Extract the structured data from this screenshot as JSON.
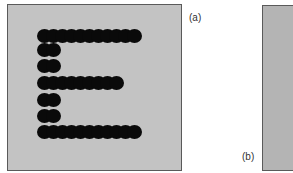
{
  "figure": {
    "panels": [
      {
        "id": "a",
        "label": "(a)",
        "content": "Letter E formed by black dots on gray background"
      },
      {
        "id": "b",
        "label": "(b)",
        "content": "Uniform gray panel (partially visible)"
      }
    ],
    "letter": "E",
    "colors": {
      "panel_a_background": "#c3c3c3",
      "panel_b_background": "#b4b4b4",
      "dot": "#0a0a0a",
      "border": "#5a5a5a"
    },
    "dot_rows": [
      {
        "y": 31,
        "x_start": 36,
        "x_end": 126,
        "count": 11
      },
      {
        "y": 45,
        "x_start": 36,
        "x_end": 45,
        "count": 2
      },
      {
        "y": 61,
        "x_start": 36,
        "x_end": 45,
        "count": 2
      },
      {
        "y": 78,
        "x_start": 36,
        "x_end": 108,
        "count": 9
      },
      {
        "y": 95,
        "x_start": 36,
        "x_end": 45,
        "count": 2
      },
      {
        "y": 111,
        "x_start": 36,
        "x_end": 45,
        "count": 2
      },
      {
        "y": 127,
        "x_start": 36,
        "x_end": 126,
        "count": 11
      }
    ]
  }
}
